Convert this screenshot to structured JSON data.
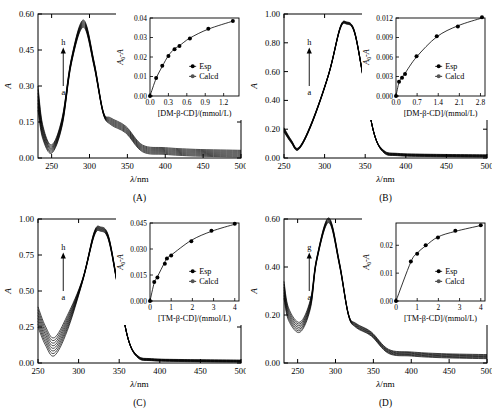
{
  "figure": {
    "panels": [
      {
        "id": "A",
        "label": "(A)",
        "main": {
          "ylabel": "A",
          "xlabel": "λ/nm",
          "xlim": [
            232,
            500
          ],
          "ylim": [
            0.0,
            0.6
          ],
          "xticks": [
            250,
            300,
            350,
            400,
            450,
            500
          ],
          "xticklabels": [
            "250",
            "300",
            "350",
            "400",
            "450",
            "500"
          ],
          "yticks": [
            0.0,
            0.15,
            0.3,
            0.45,
            0.6
          ],
          "yticklabels": [
            "0.00",
            "0.15",
            "0.30",
            "0.45",
            "0.60"
          ],
          "arrow": {
            "top": "h",
            "bottom": "a"
          },
          "series_count": 8,
          "peak_nm": 292,
          "peak_abs_top": 0.575,
          "peak_abs_bottom": 0.545,
          "valley_nm": 250,
          "valley_abs_top": 0.055,
          "valley_abs_bottom": 0.02,
          "tail_abs_top": 0.032,
          "tail_abs_bottom": 0.004
        },
        "inset": {
          "ylabel": "A₀-A",
          "xlabel": "[DM-β-CD]/(mmol/L)",
          "xlim": [
            0.0,
            1.45
          ],
          "ylim": [
            0.0,
            0.04
          ],
          "xticks": [
            0.0,
            0.3,
            0.6,
            0.9,
            1.2
          ],
          "xticklabels": [
            "0.0",
            "0.3",
            "0.6",
            "0.9",
            "1.2"
          ],
          "yticks": [
            0.0,
            0.01,
            0.02,
            0.03,
            0.04
          ],
          "yticklabels": [
            "0.00",
            "0.01",
            "0.02",
            "0.03",
            "0.04"
          ],
          "legend": [
            "Esp",
            "Calcd"
          ],
          "x": [
            0.0,
            0.1,
            0.2,
            0.3,
            0.4,
            0.48,
            0.65,
            0.95,
            1.35
          ],
          "y_esp": [
            0.0,
            0.0092,
            0.0155,
            0.0205,
            0.024,
            0.0256,
            0.0295,
            0.0345,
            0.0385
          ],
          "y_calcd": [
            0.0,
            0.009,
            0.0152,
            0.0207,
            0.0242,
            0.0258,
            0.0297,
            0.0343,
            0.0384
          ]
        }
      },
      {
        "id": "B",
        "label": "(B)",
        "main": {
          "ylabel": "A",
          "xlabel": "λ/nm",
          "xlim": [
            250,
            500
          ],
          "ylim": [
            0.0,
            1.0
          ],
          "xticks": [
            250,
            300,
            350,
            400,
            450,
            500
          ],
          "xticklabels": [
            "250",
            "300",
            "350",
            "400",
            "450",
            "500"
          ],
          "yticks": [
            0.0,
            0.2,
            0.4,
            0.6,
            0.8,
            1.0
          ],
          "yticklabels": [
            "0.00",
            "0.20",
            "0.40",
            "0.60",
            "0.80",
            "1.00"
          ],
          "arrow": {
            "top": "h",
            "bottom": "a"
          },
          "series_count": 8,
          "peak_nm": 327,
          "peak_abs_top": 0.945,
          "peak_abs_bottom": 0.93,
          "valley_nm": 268,
          "valley_abs_top": 0.072,
          "valley_abs_bottom": 0.058,
          "tail_abs_top": 0.022,
          "tail_abs_bottom": 0.006
        },
        "inset": {
          "ylabel": "A₀-A",
          "xlabel": "[DM-β-CD]/(mmol/L)",
          "xlim": [
            0.0,
            2.95
          ],
          "ylim": [
            0.0,
            0.012
          ],
          "xticks": [
            0.0,
            0.7,
            1.4,
            2.1,
            2.8
          ],
          "xticklabels": [
            "0.0",
            "0.7",
            "1.4",
            "2.1",
            "2.8"
          ],
          "yticks": [
            0.0,
            0.003,
            0.006,
            0.009,
            0.012
          ],
          "yticklabels": [
            "0.000",
            "0.003",
            "0.006",
            "0.009",
            "0.012"
          ],
          "legend": [
            "Esp",
            "Calcd"
          ],
          "x": [
            0.0,
            0.1,
            0.2,
            0.3,
            0.68,
            1.35,
            2.05,
            2.85
          ],
          "y_esp": [
            0.0,
            0.0022,
            0.0028,
            0.0034,
            0.0061,
            0.0092,
            0.0107,
            0.0121
          ],
          "y_calcd": [
            0.0,
            0.0021,
            0.0029,
            0.0035,
            0.006,
            0.0091,
            0.0108,
            0.012
          ]
        }
      },
      {
        "id": "C",
        "label": "(C)",
        "main": {
          "ylabel": "A",
          "xlabel": "λ/nm",
          "xlim": [
            250,
            500
          ],
          "ylim": [
            0.0,
            1.0
          ],
          "xticks": [
            250,
            300,
            350,
            400,
            450,
            500
          ],
          "xticklabels": [
            "250",
            "300",
            "350",
            "400",
            "450",
            "500"
          ],
          "yticks": [
            0.0,
            0.25,
            0.5,
            0.75,
            1.0
          ],
          "yticklabels": [
            "0.00",
            "0.25",
            "0.50",
            "0.75",
            "1.00"
          ],
          "arrow": {
            "top": "h",
            "bottom": "a"
          },
          "series_count": 8,
          "peak_nm": 327,
          "peak_abs_top": 0.945,
          "peak_abs_bottom": 0.915,
          "valley_nm": 270,
          "valley_abs_top": 0.175,
          "valley_abs_bottom": 0.05,
          "tail_abs_top": 0.02,
          "tail_abs_bottom": 0.006
        },
        "inset": {
          "ylabel": "A₀-A",
          "xlabel": "[TM-β-CD]/(mmol/L)",
          "xlim": [
            0.0,
            4.2
          ],
          "ylim": [
            0.0,
            0.045
          ],
          "xticks": [
            0,
            1,
            2,
            3,
            4
          ],
          "xticklabels": [
            "0",
            "1",
            "2",
            "3",
            "4"
          ],
          "yticks": [
            0.0,
            0.015,
            0.03,
            0.045
          ],
          "yticklabels": [
            "0.000",
            "0.015",
            "0.030",
            "0.045"
          ],
          "legend": [
            "Esp",
            "Calcd"
          ],
          "x": [
            0.0,
            0.2,
            0.35,
            0.7,
            0.8,
            1.0,
            1.95,
            2.9,
            4.0
          ],
          "y_esp": [
            0.0,
            0.011,
            0.0135,
            0.0215,
            0.0245,
            0.0262,
            0.0345,
            0.0405,
            0.0445
          ],
          "y_calcd": [
            0.0,
            0.0105,
            0.014,
            0.0225,
            0.0248,
            0.0265,
            0.035,
            0.0402,
            0.0443
          ]
        }
      },
      {
        "id": "D",
        "label": "(D)",
        "main": {
          "ylabel": "A",
          "xlabel": "λ/nm",
          "xlim": [
            232,
            500
          ],
          "ylim": [
            0.0,
            0.6
          ],
          "xticks": [
            250,
            300,
            350,
            400,
            450,
            500
          ],
          "xticklabels": [
            "250",
            "300",
            "350",
            "400",
            "450",
            "500"
          ],
          "yticks": [
            0.0,
            0.2,
            0.4,
            0.6
          ],
          "yticklabels": [
            "0.00",
            "0.20",
            "0.40",
            "0.60"
          ],
          "arrow": {
            "top": "g",
            "bottom": "a"
          },
          "series_count": 7,
          "peak_nm": 291,
          "peak_abs_top": 0.605,
          "peak_abs_bottom": 0.585,
          "valley_nm": 253,
          "valley_abs_top": 0.17,
          "valley_abs_bottom": 0.128,
          "tail_abs_top": 0.035,
          "tail_abs_bottom": 0.018
        },
        "inset": {
          "ylabel": "A₀-A",
          "xlabel": "[TM-β-CD]/(mmol/L)",
          "xlim": [
            0.0,
            4.2
          ],
          "ylim": [
            0.0,
            0.028
          ],
          "xticks": [
            0,
            1,
            2,
            3,
            4
          ],
          "xticklabels": [
            "0",
            "1",
            "2",
            "3",
            "4"
          ],
          "yticks": [
            0.0,
            0.01,
            0.02
          ],
          "yticklabels": [
            "0.00",
            "0.01",
            "0.02"
          ],
          "legend": [
            "Esp",
            "Calcd"
          ],
          "x": [
            0.0,
            0.7,
            1.0,
            1.4,
            1.98,
            2.8,
            4.0
          ],
          "y_esp": [
            0.0,
            0.0142,
            0.017,
            0.02,
            0.0228,
            0.0252,
            0.0272
          ],
          "y_calcd": [
            0.0,
            0.014,
            0.0172,
            0.0198,
            0.023,
            0.025,
            0.0271
          ]
        }
      }
    ]
  },
  "chart_data": {
    "type": "line",
    "title": "",
    "panels": [
      {
        "panel": "A",
        "main": {
          "xlabel": "λ/nm",
          "ylabel": "A",
          "xlim": [
            232,
            500
          ],
          "ylim": [
            0.0,
            0.6
          ],
          "series_labels": [
            "a",
            "b",
            "c",
            "d",
            "e",
            "f",
            "g",
            "h"
          ],
          "peak": {
            "x": 292,
            "y_range": [
              0.545,
              0.575
            ]
          },
          "valley": {
            "x": 250,
            "y_range": [
              0.02,
              0.055
            ]
          },
          "grid": false
        },
        "inset": {
          "type": "scatter",
          "xlabel": "[DM-β-CD]/(mmol/L)",
          "ylabel": "A₀-A",
          "xlim": [
            0.0,
            1.45
          ],
          "ylim": [
            0.0,
            0.04
          ],
          "x": [
            0.0,
            0.1,
            0.2,
            0.3,
            0.4,
            0.48,
            0.65,
            0.95,
            1.35
          ],
          "series": [
            {
              "name": "Esp",
              "values": [
                0.0,
                0.0092,
                0.0155,
                0.0205,
                0.024,
                0.0256,
                0.0295,
                0.0345,
                0.0385
              ]
            },
            {
              "name": "Calcd",
              "values": [
                0.0,
                0.009,
                0.0152,
                0.0207,
                0.0242,
                0.0258,
                0.0297,
                0.0343,
                0.0384
              ]
            }
          ],
          "legend_position": "lower-right"
        }
      },
      {
        "panel": "B",
        "main": {
          "xlabel": "λ/nm",
          "ylabel": "A",
          "xlim": [
            250,
            500
          ],
          "ylim": [
            0.0,
            1.0
          ],
          "series_labels": [
            "a",
            "b",
            "c",
            "d",
            "e",
            "f",
            "g",
            "h"
          ],
          "peak": {
            "x": 327,
            "y_range": [
              0.93,
              0.945
            ]
          },
          "valley": {
            "x": 268,
            "y_range": [
              0.058,
              0.072
            ]
          },
          "grid": false
        },
        "inset": {
          "type": "scatter",
          "xlabel": "[DM-β-CD]/(mmol/L)",
          "ylabel": "A₀-A",
          "xlim": [
            0.0,
            2.95
          ],
          "ylim": [
            0.0,
            0.012
          ],
          "x": [
            0.0,
            0.1,
            0.2,
            0.3,
            0.68,
            1.35,
            2.05,
            2.85
          ],
          "series": [
            {
              "name": "Esp",
              "values": [
                0.0,
                0.0022,
                0.0028,
                0.0034,
                0.0061,
                0.0092,
                0.0107,
                0.0121
              ]
            },
            {
              "name": "Calcd",
              "values": [
                0.0,
                0.0021,
                0.0029,
                0.0035,
                0.006,
                0.0091,
                0.0108,
                0.012
              ]
            }
          ],
          "legend_position": "lower-right"
        }
      },
      {
        "panel": "C",
        "main": {
          "xlabel": "λ/nm",
          "ylabel": "A",
          "xlim": [
            250,
            500
          ],
          "ylim": [
            0.0,
            1.0
          ],
          "series_labels": [
            "a",
            "b",
            "c",
            "d",
            "e",
            "f",
            "g",
            "h"
          ],
          "peak": {
            "x": 327,
            "y_range": [
              0.915,
              0.945
            ]
          },
          "valley": {
            "x": 270,
            "y_range": [
              0.05,
              0.175
            ]
          },
          "grid": false
        },
        "inset": {
          "type": "scatter",
          "xlabel": "[TM-β-CD]/(mmol/L)",
          "ylabel": "A₀-A",
          "xlim": [
            0.0,
            4.2
          ],
          "ylim": [
            0.0,
            0.045
          ],
          "x": [
            0.0,
            0.2,
            0.35,
            0.7,
            0.8,
            1.0,
            1.95,
            2.9,
            4.0
          ],
          "series": [
            {
              "name": "Esp",
              "values": [
                0.0,
                0.011,
                0.0135,
                0.0215,
                0.0245,
                0.0262,
                0.0345,
                0.0405,
                0.0445
              ]
            },
            {
              "name": "Calcd",
              "values": [
                0.0,
                0.0105,
                0.014,
                0.0225,
                0.0248,
                0.0265,
                0.035,
                0.0402,
                0.0443
              ]
            }
          ],
          "legend_position": "lower-right"
        }
      },
      {
        "panel": "D",
        "main": {
          "xlabel": "λ/nm",
          "ylabel": "A",
          "xlim": [
            232,
            500
          ],
          "ylim": [
            0.0,
            0.6
          ],
          "series_labels": [
            "a",
            "b",
            "c",
            "d",
            "e",
            "f",
            "g"
          ],
          "peak": {
            "x": 291,
            "y_range": [
              0.585,
              0.605
            ]
          },
          "valley": {
            "x": 253,
            "y_range": [
              0.128,
              0.17
            ]
          },
          "grid": false
        },
        "inset": {
          "type": "scatter",
          "xlabel": "[TM-β-CD]/(mmol/L)",
          "ylabel": "A₀-A",
          "xlim": [
            0.0,
            4.2
          ],
          "ylim": [
            0.0,
            0.028
          ],
          "x": [
            0.0,
            0.7,
            1.0,
            1.4,
            1.98,
            2.8,
            4.0
          ],
          "series": [
            {
              "name": "Esp",
              "values": [
                0.0,
                0.0142,
                0.017,
                0.02,
                0.0228,
                0.0252,
                0.0272
              ]
            },
            {
              "name": "Calcd",
              "values": [
                0.0,
                0.014,
                0.0172,
                0.0198,
                0.023,
                0.025,
                0.0271
              ]
            }
          ],
          "legend_position": "lower-right"
        }
      }
    ]
  }
}
